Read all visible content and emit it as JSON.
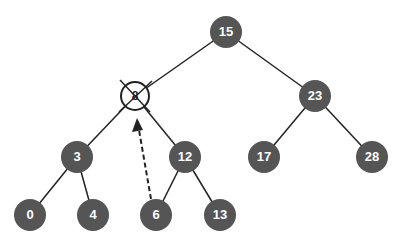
{
  "diagram": {
    "type": "binary-search-tree",
    "node_color": "#555555",
    "edge_color": "#222222",
    "nodes": [
      {
        "id": "n15",
        "label": "15",
        "x": 226,
        "y": 32,
        "deleted": false
      },
      {
        "id": "n8",
        "label": "8",
        "x": 135,
        "y": 96,
        "deleted": true
      },
      {
        "id": "n23",
        "label": "23",
        "x": 315,
        "y": 96,
        "deleted": false
      },
      {
        "id": "n3",
        "label": "3",
        "x": 77,
        "y": 157,
        "deleted": false
      },
      {
        "id": "n12",
        "label": "12",
        "x": 185,
        "y": 157,
        "deleted": false
      },
      {
        "id": "n17",
        "label": "17",
        "x": 264,
        "y": 157,
        "deleted": false
      },
      {
        "id": "n28",
        "label": "28",
        "x": 372,
        "y": 157,
        "deleted": false
      },
      {
        "id": "n0",
        "label": "0",
        "x": 30,
        "y": 215,
        "deleted": false
      },
      {
        "id": "n4",
        "label": "4",
        "x": 93,
        "y": 215,
        "deleted": false
      },
      {
        "id": "n6",
        "label": "6",
        "x": 156,
        "y": 215,
        "deleted": false
      },
      {
        "id": "n13",
        "label": "13",
        "x": 220,
        "y": 215,
        "deleted": false
      }
    ],
    "edges": [
      [
        "n15",
        "n8"
      ],
      [
        "n15",
        "n23"
      ],
      [
        "n8",
        "n3"
      ],
      [
        "n8",
        "n12"
      ],
      [
        "n23",
        "n17"
      ],
      [
        "n23",
        "n28"
      ],
      [
        "n3",
        "n0"
      ],
      [
        "n3",
        "n4"
      ],
      [
        "n12",
        "n6"
      ],
      [
        "n12",
        "n13"
      ]
    ],
    "replacement_arrow": {
      "from": "n6",
      "to": "n8",
      "style": "dashed"
    }
  }
}
